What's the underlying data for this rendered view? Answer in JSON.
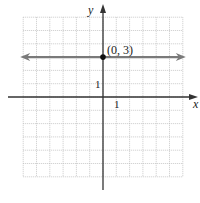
{
  "chart_data": {
    "type": "line",
    "title": "",
    "xlabel": "x",
    "ylabel": "y",
    "xlim": [
      -6,
      6
    ],
    "ylim": [
      -6,
      6
    ],
    "grid": true,
    "tick_labels": {
      "x": [
        "1"
      ],
      "y": [
        "1"
      ]
    },
    "series": [
      {
        "name": "y = 3",
        "kind": "horizontal-line",
        "equation": "y = 3",
        "x": [
          -6,
          6
        ],
        "y": [
          3,
          3
        ],
        "arrows_both_ends": true
      }
    ],
    "points": [
      {
        "label": "(0, 3)",
        "x": 0,
        "y": 3
      }
    ],
    "colors": {
      "line": "#7a7a7a",
      "axes": "#333333",
      "grid": "#bdbdbd",
      "point": "#111111"
    }
  },
  "labels": {
    "x_axis": "x",
    "y_axis": "y",
    "x_tick": "1",
    "y_tick": "1",
    "point": "(0, 3)"
  }
}
